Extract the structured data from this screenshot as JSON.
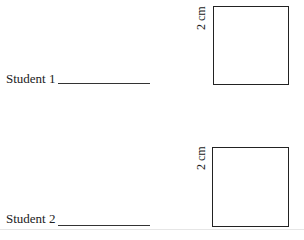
{
  "items": [
    {
      "student_label": "Student 1",
      "square": {
        "side_label": "2 cm"
      }
    },
    {
      "student_label": "Student 2",
      "square": {
        "side_label": "2 cm"
      }
    }
  ]
}
